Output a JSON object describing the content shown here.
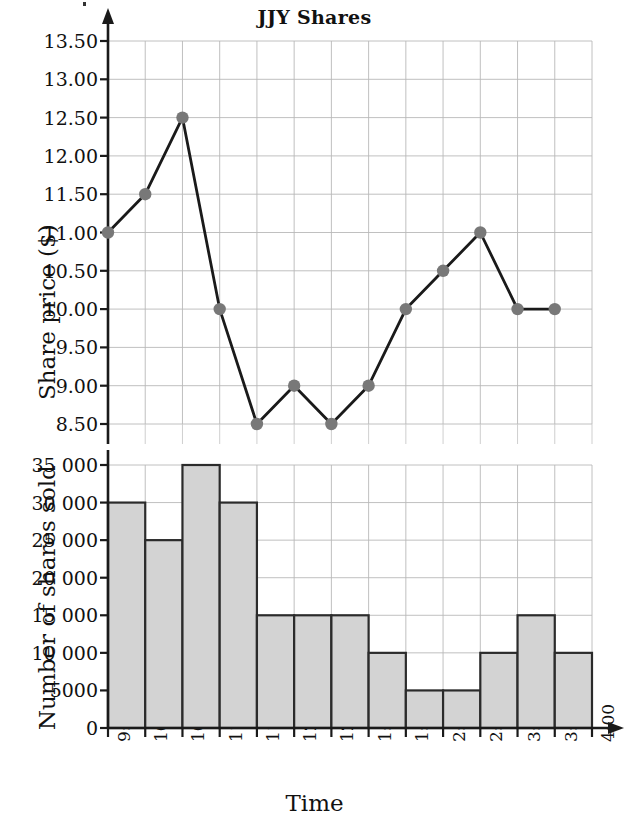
{
  "title": "JJY Shares",
  "axis_titles": {
    "y_top": "Share price ($)",
    "y_bottom": "Number of shares sold",
    "x": "Time"
  },
  "chart_data": [
    {
      "type": "line",
      "title": "JJY Shares",
      "xlabel": "Time",
      "ylabel": "Share price ($)",
      "ylim": [
        8.0,
        13.75
      ],
      "grid": true,
      "legend": "none",
      "marker": "filled-circle",
      "marker_color": "#787878",
      "line_color": "#1a1a1a",
      "ytick_labels": [
        "13.50",
        "13.00",
        "12.50",
        "12.00",
        "11.50",
        "11.00",
        "10.50",
        "10.00",
        "9.50",
        "9.00",
        "8.50"
      ],
      "ytick_values": [
        13.5,
        13.0,
        12.5,
        12.0,
        11.5,
        11.0,
        10.5,
        10.0,
        9.5,
        9.0,
        8.5
      ],
      "categories": [
        "9:30",
        "10:00",
        "10:30",
        "11:00",
        "11:30",
        "12:00",
        "12:30",
        "1:00",
        "1:30",
        "2:00",
        "2:30",
        "3:00",
        "3:30",
        "4:00"
      ],
      "values": [
        11.0,
        11.5,
        12.5,
        10.0,
        8.5,
        9.0,
        8.5,
        9.0,
        10.0,
        10.5,
        11.0,
        10.0,
        10.0
      ]
    },
    {
      "type": "bar",
      "xlabel": "Time",
      "ylabel": "Number of shares sold",
      "ylim": [
        0,
        36000
      ],
      "grid": true,
      "legend": "none",
      "bar_fill": "#d3d3d3",
      "bar_stroke": "#2b2b2b",
      "ytick_labels": [
        "35 000",
        "30 000",
        "25 000",
        "20 000",
        "15 000",
        "10 000",
        "5000",
        "0"
      ],
      "ytick_values": [
        35000,
        30000,
        25000,
        20000,
        15000,
        10000,
        5000,
        0
      ],
      "categories": [
        "9:30",
        "10:00",
        "10:30",
        "11:00",
        "11:30",
        "12:00",
        "12:30",
        "1:00",
        "1:30",
        "2:00",
        "2:30",
        "3:00",
        "3:30",
        "4:00"
      ],
      "values": [
        30000,
        25000,
        35000,
        30000,
        15000,
        15000,
        15000,
        10000,
        5000,
        5000,
        10000,
        15000,
        10000
      ]
    }
  ],
  "xtick_labels": [
    "9:30",
    "10:00",
    "10:30",
    "11:00",
    "11:30",
    "12:00",
    "12:30",
    "1:00",
    "1:30",
    "2:00",
    "2:30",
    "3:00",
    "3:30",
    "4:00"
  ]
}
